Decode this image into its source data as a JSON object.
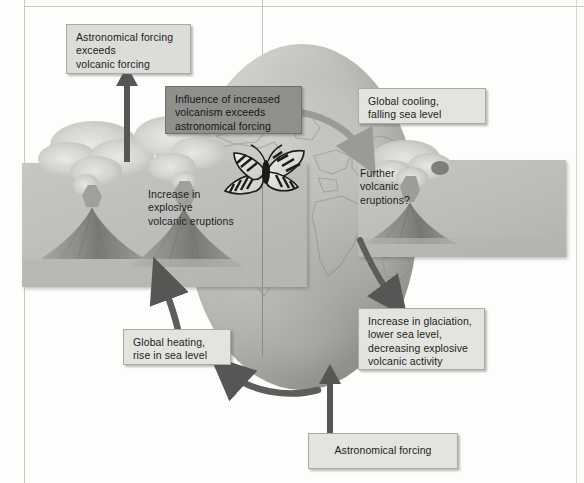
{
  "figure": {
    "type": "cycle-feedback-diagram",
    "background_color": "#fdfdfc",
    "globe_color": "#bdbdba",
    "box_color": "#dcdcd9",
    "dark_box_color": "#8f8f8c",
    "arrow_dark_color": "#5a5a58",
    "arrow_light_color": "#9a9a97"
  },
  "boxes": {
    "astro_exceeds": {
      "lines": [
        "Astronomical forcing",
        "exceeds",
        "volcanic forcing"
      ],
      "style": "light"
    },
    "influence": {
      "lines": [
        "Influence of increased",
        "volcanism exceeds",
        "astronomical forcing"
      ],
      "style": "dark"
    },
    "global_cooling": {
      "lines": [
        "Global cooling,",
        "falling sea level"
      ],
      "style": "light"
    },
    "further_eruptions": {
      "lines": [
        "Further",
        "volcanic",
        "eruptions?"
      ],
      "style": "overlay"
    },
    "increase_explosive": {
      "lines": [
        "Increase in",
        "explosive",
        "volcanic eruptions"
      ],
      "style": "overlay"
    },
    "glaciation": {
      "lines": [
        "Increase in glaciation,",
        "lower sea level,",
        "decreasing explosive",
        "volcanic activity"
      ],
      "style": "light"
    },
    "global_heating": {
      "lines": [
        "Global heating,",
        "rise in sea level"
      ],
      "style": "light"
    },
    "astro_forcing": {
      "lines": [
        "Astronomical forcing"
      ],
      "style": "light"
    }
  },
  "panels": {
    "left": {
      "label": "two-erupting-volcanoes-photo",
      "volcano_count": 2
    },
    "right": {
      "label": "single-erupting-volcano-photo",
      "volcano_count": 1
    }
  },
  "globe": {
    "label": "earth-globe-with-world-map"
  },
  "butterfly": {
    "label": "pinned-swallowtail-butterfly-specimen"
  },
  "arrows": [
    {
      "name": "arrow-panel-to-astro-exceeds",
      "from": "left-volcano-panel",
      "to": "astro_exceeds",
      "direction": "up",
      "tone": "dark"
    },
    {
      "name": "arrow-globe-to-further-eruptions",
      "from": "globe-top",
      "to": "further_eruptions",
      "direction": "down-right",
      "tone": "light"
    },
    {
      "name": "arrow-cooling-to-glaciation",
      "from": "global_cooling",
      "to": "glaciation",
      "direction": "down-right",
      "tone": "dark"
    },
    {
      "name": "arrow-astro-forcing-to-globe",
      "from": "astro_forcing",
      "to": "globe-bottom",
      "direction": "up",
      "tone": "dark"
    },
    {
      "name": "arrow-globe-bottom-to-global-heating",
      "from": "globe-bottom",
      "to": "global_heating",
      "direction": "left",
      "tone": "dark"
    },
    {
      "name": "arrow-global-heating-to-panel",
      "from": "global_heating",
      "to": "left-volcano-panel",
      "direction": "up-left",
      "tone": "dark"
    }
  ]
}
